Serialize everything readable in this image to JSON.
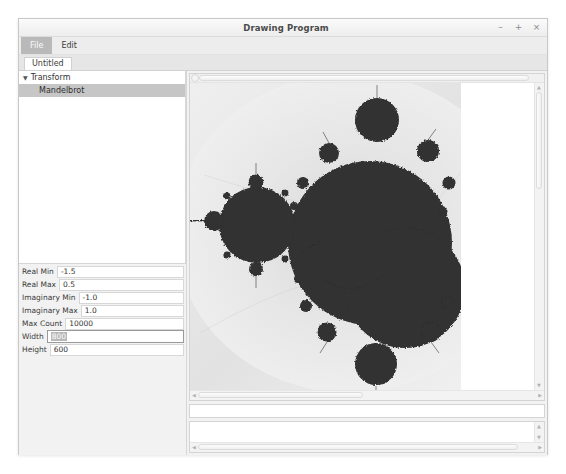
{
  "window": {
    "title": "Drawing Program",
    "controls": [
      {
        "name": "minimize",
        "glyph": "–"
      },
      {
        "name": "maximize",
        "glyph": "+"
      },
      {
        "name": "close",
        "glyph": "×"
      }
    ]
  },
  "menubar": {
    "items": [
      {
        "label": "File",
        "active": true
      },
      {
        "label": "Edit",
        "active": false
      }
    ]
  },
  "tabs": [
    {
      "label": "Untitled",
      "active": true
    }
  ],
  "tree": {
    "root": {
      "label": "Transform",
      "expanded": true,
      "triangle": "▼"
    },
    "children": [
      {
        "label": "Mandelbrot",
        "selected": true
      }
    ]
  },
  "properties": {
    "fields": [
      {
        "label": "Real Min",
        "value": "-1.5",
        "focused": false,
        "selected": false
      },
      {
        "label": "Real Max",
        "value": "0.5",
        "focused": false,
        "selected": false
      },
      {
        "label": "Imaginary Min",
        "value": "-1.0",
        "focused": false,
        "selected": false
      },
      {
        "label": "Imaginary Max",
        "value": "1.0",
        "focused": false,
        "selected": false
      },
      {
        "label": "Max Count",
        "value": "10000",
        "focused": false,
        "selected": false
      },
      {
        "label": "Width",
        "value": "800",
        "focused": true,
        "selected": true
      },
      {
        "label": "Height",
        "value": "600",
        "focused": false,
        "selected": false
      }
    ]
  },
  "canvas": {
    "image_name": "mandelbrot-set-render",
    "description": "Grayscale Mandelbrot set fractal render",
    "background": "#ffffff",
    "set_color": "#303030"
  },
  "message_field": {
    "value": "",
    "placeholder": ""
  },
  "log_panel": {
    "text": ""
  },
  "colors": {
    "window_bg": "#f2f2f2",
    "panel_bg": "#ffffff",
    "selection": "#c6c6c6",
    "menu_active": "#b9b9b9",
    "border": "#d6d6d6"
  }
}
